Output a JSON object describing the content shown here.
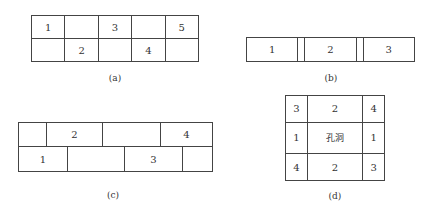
{
  "panels": {
    "a": {
      "caption": "(a)",
      "rows": [
        [
          "1",
          "",
          "3",
          "",
          "5"
        ],
        [
          "",
          "2",
          "",
          "4",
          ""
        ]
      ]
    },
    "b": {
      "caption": "(b)",
      "rows": [
        [
          "1",
          "",
          "2",
          "",
          "3"
        ]
      ]
    },
    "c": {
      "caption": "(c)",
      "row1": [
        "",
        "2",
        "",
        "4"
      ],
      "row2": [
        "1",
        "",
        "3",
        ""
      ]
    },
    "d": {
      "caption": "(d)",
      "rows": [
        [
          "3",
          "2",
          "4"
        ],
        [
          "1",
          "孔洞",
          "1"
        ],
        [
          "4",
          "2",
          "3"
        ]
      ]
    }
  }
}
